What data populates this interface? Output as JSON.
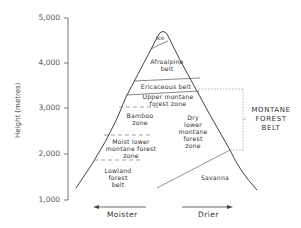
{
  "y_axis": {
    "label": "Height (metres)",
    "ticks": [
      "5,000",
      "4,000",
      "3,000",
      "2,000",
      "1,000"
    ]
  },
  "zones": {
    "ice": "Ice",
    "afroalpine": [
      "Afroalpine",
      "belt"
    ],
    "ericaceous": "Ericaceous belt",
    "upper_montane": [
      "Upper montane",
      "forest zone"
    ],
    "bamboo": [
      "Bamboo",
      "zone"
    ],
    "moist_lower": [
      "Moist lower",
      "montane forest",
      "zone"
    ],
    "lowland": [
      "Lowland",
      "forest",
      "belt"
    ],
    "dry_lower": [
      "Dry",
      "lower",
      "montane",
      "forest",
      "zone"
    ],
    "savanna": "Savanna"
  },
  "bracket": {
    "label": [
      "MONTANE",
      "FOREST",
      "BELT"
    ]
  },
  "directions": {
    "left": "Moister",
    "right": "Drier"
  },
  "colors": {
    "line": "#444444",
    "text": "#333333"
  }
}
